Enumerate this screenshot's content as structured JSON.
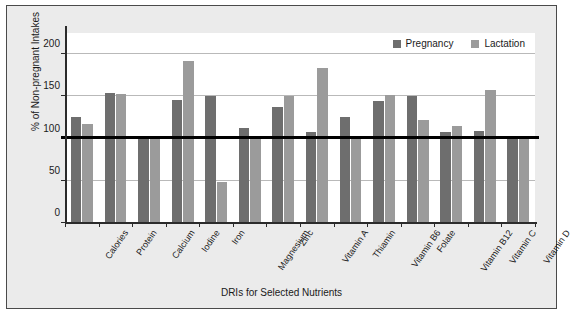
{
  "chart_data": {
    "type": "bar",
    "title": "",
    "xlabel": "DRIs for Selected Nutrients",
    "ylabel": "% of Non-pregnant Intakes",
    "ylim": [
      0,
      225
    ],
    "yticks": [
      0,
      50,
      100,
      150,
      200
    ],
    "grid": true,
    "legend_position": "top-right",
    "reference_line": 100,
    "categories": [
      "Calories",
      "Protein",
      "Calcium",
      "Iodine",
      "Iron",
      "Magnesium",
      "Zinc",
      "Vitamin A",
      "Thiamin",
      "Vitamin B6",
      "Folate",
      "Vitamin B12",
      "Vitamin C",
      "Vitamin D"
    ],
    "series": [
      {
        "name": "Pregnancy",
        "color": "#6e6e6e",
        "values": [
          125,
          154,
          100,
          146,
          150,
          112,
          137,
          108,
          126,
          145,
          150,
          108,
          109,
          100
        ]
      },
      {
        "name": "Lactation",
        "color": "#9b9b9b",
        "values": [
          117,
          153,
          100,
          192,
          48,
          100,
          150,
          183,
          100,
          152,
          122,
          115,
          157,
          100
        ]
      }
    ]
  },
  "legend": {
    "items": [
      {
        "label": "Pregnancy"
      },
      {
        "label": "Lactation"
      }
    ]
  },
  "axes": {
    "y_tick_labels": [
      "0",
      "50",
      "100",
      "150",
      "200"
    ]
  }
}
